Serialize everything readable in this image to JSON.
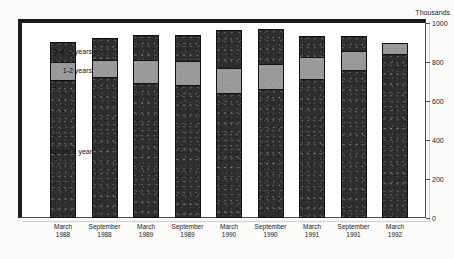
{
  "figure": {
    "title": "",
    "axis_unit_label": "Thousands"
  },
  "chart_data": {
    "type": "bar",
    "stacked": true,
    "title": "",
    "xlabel": "",
    "ylabel": "Thousands",
    "ylim": [
      0,
      1000
    ],
    "yticks": [
      0,
      200,
      400,
      600,
      800,
      1000
    ],
    "grid": false,
    "legend_position": "in-plot-left",
    "categories": [
      "March 1988",
      "September 1988",
      "March 1989",
      "September 1989",
      "March 1990",
      "September 1990",
      "March 1991",
      "September 1991",
      "March 1992"
    ],
    "category_lines": [
      [
        "March",
        "1988"
      ],
      [
        "September",
        "1988"
      ],
      [
        "March",
        "1989"
      ],
      [
        "September",
        "1989"
      ],
      [
        "March",
        "1990"
      ],
      [
        "September",
        "1990"
      ],
      [
        "March",
        "1991"
      ],
      [
        "September",
        "1991"
      ],
      [
        "March",
        "1992"
      ]
    ],
    "series": [
      {
        "name": "Under 1 year",
        "color": "#2e2e2e",
        "values": [
          710,
          725,
          690,
          680,
          640,
          660,
          715,
          760,
          840
        ]
      },
      {
        "name": "1-2 years",
        "color": "#9a9a9a",
        "values": [
          90,
          85,
          120,
          125,
          130,
          130,
          110,
          95,
          60
        ]
      },
      {
        "name": "Over 2 years",
        "color": "#2e2e2e",
        "values": [
          105,
          115,
          130,
          135,
          195,
          180,
          110,
          80,
          0
        ]
      }
    ],
    "totals": [
      905,
      925,
      940,
      940,
      965,
      970,
      935,
      935,
      900
    ]
  },
  "labels": {
    "over2": "Over 2 years",
    "oneto2": "1-2 years",
    "under1": "Under 1 year"
  }
}
